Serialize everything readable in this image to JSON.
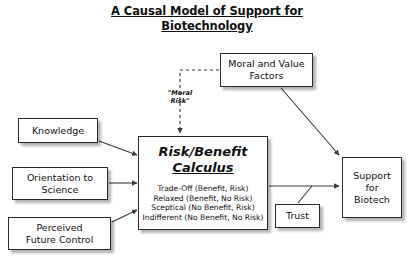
{
  "title": "A Causal Model of Support for\nBiotechnology",
  "colors": {
    "background": "#ffffff",
    "node_border": "#2b2b2b",
    "text": "#111111",
    "edge": "#3a3a3a"
  },
  "nodes": {
    "knowledge": {
      "label": "Knowledge"
    },
    "orientation": {
      "label": "Orientation to\nScience"
    },
    "perceived": {
      "label": "Perceived\nFuture Control"
    },
    "moral_factors": {
      "label": "Moral and Value\nFactors"
    },
    "trust": {
      "label": "Trust"
    },
    "support": {
      "label": "Support\nfor\nBiotech"
    },
    "calculus": {
      "heading_line1": "Risk/Benefit",
      "heading_line2": "Calculus",
      "items": "Trade-Off (Benefit, Risk)\nRelaxed (Benefit, No Risk)\nSceptical (No Benefit, Risk)\nIndifferent (No Benefit, No Risk)"
    }
  },
  "edges": {
    "moral_risk_label": "\"Moral\nRisk\"",
    "list": [
      {
        "from": "knowledge",
        "to": "calculus",
        "style": "solid"
      },
      {
        "from": "orientation",
        "to": "calculus",
        "style": "solid"
      },
      {
        "from": "perceived",
        "to": "calculus",
        "style": "solid"
      },
      {
        "from": "moral_factors",
        "to": "calculus",
        "style": "dashed",
        "label": "\"Moral Risk\""
      },
      {
        "from": "moral_factors",
        "to": "support",
        "style": "solid"
      },
      {
        "from": "calculus",
        "to": "support",
        "style": "solid"
      },
      {
        "from": "trust",
        "to": "support",
        "style": "solid"
      }
    ]
  }
}
